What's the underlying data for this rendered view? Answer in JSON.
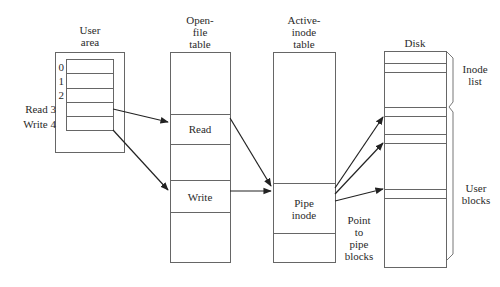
{
  "diagram": {
    "columns": {
      "user_area": {
        "title_line1": "User",
        "title_line2": "area"
      },
      "open_file_table": {
        "title_line1": "Open-",
        "title_line2": "file",
        "title_line3": "table"
      },
      "active_inode_table": {
        "title_line1": "Active-",
        "title_line2": "inode",
        "title_line3": "table"
      },
      "disk": {
        "title": "Disk"
      }
    },
    "user_area_slots": [
      {
        "index": "0",
        "label": ""
      },
      {
        "index": "1",
        "label": ""
      },
      {
        "index": "2",
        "label": ""
      },
      {
        "index": "3",
        "label": "Read"
      },
      {
        "index": "4",
        "label": "Write"
      }
    ],
    "open_file_entries": {
      "read": "Read",
      "write": "Write"
    },
    "active_inode_entry": {
      "line1": "Pipe",
      "line2": "inode"
    },
    "pointer_note": {
      "line1": "Point",
      "line2": "to",
      "line3": "pipe",
      "line4": "blocks"
    },
    "disk_regions": {
      "inode_list_line1": "Inode",
      "inode_list_line2": "list",
      "user_blocks_line1": "User",
      "user_blocks_line2": "blocks"
    },
    "colors": {
      "line": "#555555",
      "arrow": "#222222",
      "text": "#2a2a2a"
    }
  }
}
